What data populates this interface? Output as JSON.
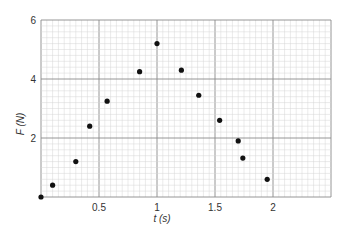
{
  "chart_data": {
    "type": "scatter",
    "title": "",
    "xlabel": "t (s)",
    "ylabel": "F (N)",
    "xlim": [
      0,
      2.5
    ],
    "ylim": [
      0,
      6
    ],
    "grid": true,
    "legend": null,
    "x_ticks": [
      {
        "value": 0.5,
        "label": "0.5"
      },
      {
        "value": 1,
        "label": "1"
      },
      {
        "value": 1.5,
        "label": "1.5"
      },
      {
        "value": 2,
        "label": "2"
      }
    ],
    "y_ticks": [
      {
        "value": 2,
        "label": "2"
      },
      {
        "value": 4,
        "label": "4"
      },
      {
        "value": 6,
        "label": "6"
      }
    ],
    "series": [
      {
        "name": "F vs t",
        "x": [
          0.0,
          0.1,
          0.3,
          0.42,
          0.57,
          0.85,
          1.0,
          1.21,
          1.36,
          1.54,
          1.7,
          1.74,
          1.95
        ],
        "y": [
          0.0,
          0.4,
          1.2,
          2.4,
          3.25,
          4.25,
          5.2,
          4.3,
          3.45,
          2.6,
          1.9,
          1.32,
          0.6
        ]
      }
    ]
  },
  "colors": {
    "minor_grid": "#d6d6d6",
    "major_grid": "#8a8a8a",
    "point": "#111111",
    "text": "#333333"
  }
}
